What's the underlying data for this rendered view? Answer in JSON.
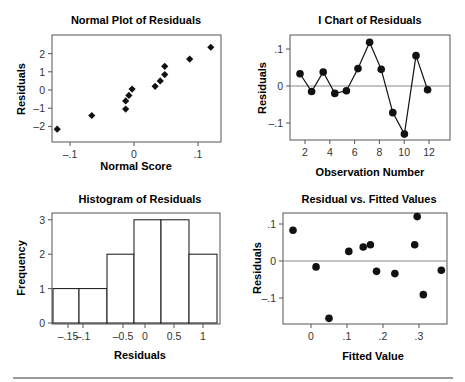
{
  "chart_data": [
    {
      "type": "scatter",
      "title": "Normal Plot of Residuals",
      "xlabel": "Normal Score",
      "ylabel": "Residuals",
      "xticks": [
        "-.1",
        "0",
        ".1"
      ],
      "yticks": [
        "2",
        "1",
        "0",
        "-1",
        "-2"
      ],
      "marker": "diamond",
      "points": [
        {
          "x": -0.12,
          "y": -2.15
        },
        {
          "x": -0.066,
          "y": -1.4
        },
        {
          "x": -0.013,
          "y": -1.05
        },
        {
          "x": -0.013,
          "y": -0.6
        },
        {
          "x": -0.008,
          "y": -0.3
        },
        {
          "x": -0.003,
          "y": 0.05
        },
        {
          "x": 0.033,
          "y": 0.2
        },
        {
          "x": 0.041,
          "y": 0.5
        },
        {
          "x": 0.048,
          "y": 0.85
        },
        {
          "x": 0.048,
          "y": 1.3
        },
        {
          "x": 0.087,
          "y": 1.7
        },
        {
          "x": 0.12,
          "y": 2.35
        }
      ]
    },
    {
      "type": "line",
      "title": "I Chart of Residuals",
      "xlabel": "Observation Number",
      "ylabel": "Residuals",
      "xticks": [
        "2",
        "4",
        "6",
        "8",
        "10",
        "12"
      ],
      "yticks": [
        ".1",
        "0",
        "-.1"
      ],
      "reference_line": 0,
      "x": [
        1,
        2,
        3,
        4,
        5,
        6,
        7,
        8,
        9,
        10,
        11,
        12
      ],
      "values": [
        0.033,
        -0.015,
        0.038,
        -0.02,
        -0.013,
        0.047,
        0.118,
        0.045,
        -0.072,
        -0.13,
        0.082,
        -0.01
      ]
    },
    {
      "type": "bar",
      "title": "Histogram of Residuals",
      "xlabel": "Residuals",
      "ylabel": "Frequency",
      "xticks": [
        "-.15",
        "-.1",
        "-0.5",
        "0",
        "0.5",
        "1"
      ],
      "yticks": [
        "3",
        "2",
        "1",
        "0"
      ],
      "values": [
        1,
        1,
        2,
        3,
        3,
        2
      ],
      "ylim": [
        0,
        3
      ]
    },
    {
      "type": "scatter",
      "title": "Residual vs. Fitted Values",
      "xlabel": "Fitted Value",
      "ylabel": "Residuals",
      "xticks": [
        "0",
        ".1",
        ".2",
        ".3"
      ],
      "yticks": [
        ".1",
        "0",
        "-.1"
      ],
      "reference_line": 0,
      "marker": "circle",
      "points": [
        {
          "x": -0.05,
          "y": 0.083
        },
        {
          "x": 0.014,
          "y": -0.016
        },
        {
          "x": 0.05,
          "y": -0.155
        },
        {
          "x": 0.105,
          "y": 0.026
        },
        {
          "x": 0.145,
          "y": 0.038
        },
        {
          "x": 0.165,
          "y": 0.044
        },
        {
          "x": 0.182,
          "y": -0.028
        },
        {
          "x": 0.233,
          "y": -0.034
        },
        {
          "x": 0.288,
          "y": 0.044
        },
        {
          "x": 0.295,
          "y": 0.12
        },
        {
          "x": 0.312,
          "y": -0.091
        },
        {
          "x": 0.362,
          "y": -0.025
        }
      ]
    }
  ]
}
